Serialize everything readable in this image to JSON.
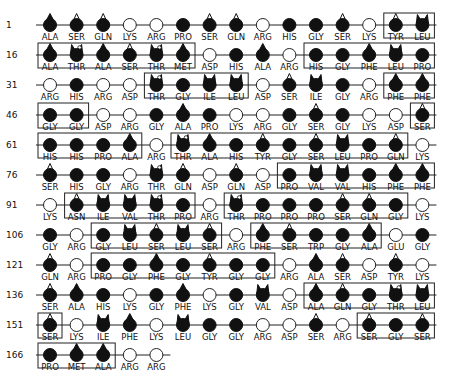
{
  "figure": {
    "layout": {
      "x0": 50,
      "dx": 26.6,
      "y0": 25,
      "dy": 30,
      "bead_radius": 6.5
    },
    "legend_shapes": {
      "open": "open circle (polar/charged: ARG, LYS, ASP, GLU)",
      "filled": "filled circle (GLY, HIS, PRO, TRP)",
      "drop": "filled circle with pointed top (ALA, PHE, MET)",
      "tip": "filled circle with small open triangle on top (SER, GLN, TYR, ASN)",
      "ears": "filled circle with two ears (LEU, ILE, VAL)",
      "ears_loop": "filled circle with ears and small loop (THR)"
    },
    "rows": [
      {
        "start": 1,
        "residues": [
          "ALA",
          "SER",
          "GLN",
          "LYS",
          "ARG",
          "PRO",
          "SER",
          "GLN",
          "ARG",
          "HIS",
          "GLY",
          "SER",
          "LYS",
          "TYR",
          "LEU"
        ],
        "boxes": [
          [
            13,
            14
          ]
        ]
      },
      {
        "start": 16,
        "residues": [
          "ALA",
          "THR",
          "ALA",
          "SER",
          "THR",
          "MET",
          "ASP",
          "HIS",
          "ALA",
          "ARG",
          "HIS",
          "GLY",
          "PHE",
          "LEU",
          "PRO"
        ],
        "boxes": [
          [
            0,
            5
          ],
          [
            10,
            14
          ]
        ]
      },
      {
        "start": 31,
        "residues": [
          "ARG",
          "HIS",
          "ARG",
          "ASP",
          "THR",
          "GLY",
          "ILE",
          "LEU",
          "ASP",
          "SER",
          "ILE",
          "GLY",
          "ARG",
          "PHE",
          "PHE"
        ],
        "boxes": [
          [
            4,
            7
          ],
          [
            13,
            14
          ]
        ]
      },
      {
        "start": 46,
        "residues": [
          "GLY",
          "GLY",
          "ASP",
          "ARG",
          "GLY",
          "ALA",
          "PRO",
          "LYS",
          "ARG",
          "GLY",
          "SER",
          "GLY",
          "LYS",
          "ASP",
          "SER"
        ],
        "boxes": [
          [
            0,
            1
          ],
          [
            14,
            14
          ]
        ]
      },
      {
        "start": 61,
        "residues": [
          "HIS",
          "HIS",
          "PRO",
          "ALA",
          "ARG",
          "THR",
          "ALA",
          "HIS",
          "TYR",
          "GLY",
          "SER",
          "LEU",
          "PRO",
          "GLN",
          "LYS"
        ],
        "boxes": [
          [
            0,
            3
          ],
          [
            5,
            13
          ]
        ]
      },
      {
        "start": 76,
        "residues": [
          "SER",
          "HIS",
          "GLY",
          "ARG",
          "THR",
          "GLN",
          "ASP",
          "GLN",
          "ASP",
          "PRO",
          "VAL",
          "VAL",
          "HIS",
          "PHE",
          "PHE"
        ],
        "boxes": [
          [
            9,
            14
          ]
        ]
      },
      {
        "start": 91,
        "residues": [
          "LYS",
          "ASN",
          "ILE",
          "VAL",
          "THR",
          "PRO",
          "ARG",
          "THR",
          "PRO",
          "PRO",
          "PRO",
          "SER",
          "GLN",
          "GLY",
          "LYS"
        ],
        "boxes": [
          [
            1,
            5
          ],
          [
            7,
            13
          ]
        ]
      },
      {
        "start": 106,
        "residues": [
          "GLY",
          "ARG",
          "GLY",
          "LEU",
          "SER",
          "LEU",
          "SER",
          "ARG",
          "PHE",
          "SER",
          "TRP",
          "GLY",
          "ALA",
          "GLU",
          "GLY"
        ],
        "boxes": [
          [
            2,
            6
          ],
          [
            8,
            12
          ]
        ]
      },
      {
        "start": 121,
        "residues": [
          "GLN",
          "ARG",
          "PRO",
          "GLY",
          "PHE",
          "GLY",
          "TYR",
          "GLY",
          "GLY",
          "ARG",
          "ALA",
          "SER",
          "ASP",
          "TYR",
          "LYS"
        ],
        "boxes": [
          [
            2,
            8
          ]
        ]
      },
      {
        "start": 136,
        "residues": [
          "SER",
          "ALA",
          "HIS",
          "LYS",
          "GLY",
          "PHE",
          "LYS",
          "GLY",
          "VAL",
          "ASP",
          "ALA",
          "GLN",
          "GLY",
          "THR",
          "LEU"
        ],
        "boxes": [
          [
            10,
            14
          ]
        ]
      },
      {
        "start": 151,
        "residues": [
          "SER",
          "LYS",
          "ILE",
          "PHE",
          "LYS",
          "LEU",
          "GLY",
          "GLY",
          "ARG",
          "ASP",
          "SER",
          "ARG",
          "SER",
          "GLY",
          "SER"
        ],
        "boxes": [
          [
            0,
            0
          ],
          [
            12,
            14
          ]
        ]
      },
      {
        "start": 166,
        "residues": [
          "PRO",
          "MET",
          "ALA",
          "ARG",
          "ARG"
        ],
        "boxes": [
          [
            0,
            2
          ]
        ]
      }
    ],
    "shape_map": {
      "ARG": "open",
      "LYS": "open",
      "ASP": "open",
      "GLU": "open",
      "GLY": "filled",
      "HIS": "filled",
      "PRO": "filled",
      "TRP": "filled",
      "ALA": "drop",
      "PHE": "drop",
      "MET": "drop",
      "SER": "tip",
      "GLN": "tip",
      "TYR": "tip",
      "ASN": "tip",
      "LEU": "ears",
      "ILE": "ears",
      "VAL": "ears",
      "THR": "ears_loop"
    }
  }
}
